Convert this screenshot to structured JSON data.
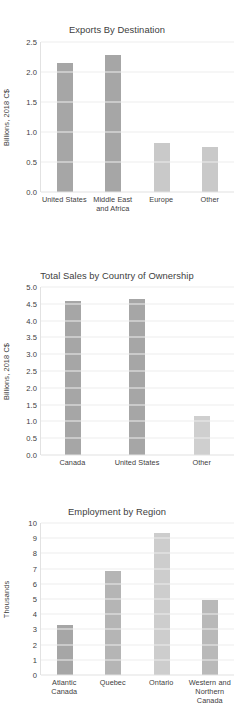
{
  "chart_data": [
    {
      "type": "bar",
      "title": "Exports By Destination",
      "xlabel": "",
      "ylabel": "Billions, 2018 C$",
      "categories": [
        "United States",
        "Middle East and Africa",
        "Europe",
        "Other"
      ],
      "values": [
        2.15,
        2.28,
        0.82,
        0.75
      ],
      "ylim": [
        0,
        2.5
      ],
      "yticks": [
        "0.0",
        "0.5",
        "1.0",
        "1.5",
        "2.0",
        "2.5"
      ],
      "ytick_values": [
        0,
        0.5,
        1,
        1.5,
        2,
        2.5
      ],
      "bar_colors": [
        "#a6a6a6",
        "#a6a6a6",
        "#c9c9c9",
        "#c9c9c9"
      ],
      "grid": true,
      "legend": "none"
    },
    {
      "type": "bar",
      "title": "Total Sales by Country of Ownership",
      "xlabel": "",
      "ylabel": "Billions, 2018 C$",
      "categories": [
        "Canada",
        "United States",
        "Other"
      ],
      "values": [
        4.57,
        4.63,
        1.17
      ],
      "ylim": [
        0,
        5.0
      ],
      "yticks": [
        "0.0",
        "0.5",
        "1.0",
        "1.5",
        "2.0",
        "2.5",
        "3.0",
        "3.5",
        "4.0",
        "4.5",
        "5.0"
      ],
      "ytick_values": [
        0,
        0.5,
        1,
        1.5,
        2,
        2.5,
        3,
        3.5,
        4,
        4.5,
        5
      ],
      "bar_colors": [
        "#a6a6a6",
        "#a6a6a6",
        "#cfcfcf"
      ],
      "grid": true,
      "legend": "none"
    },
    {
      "type": "bar",
      "title": "Employment by Region",
      "xlabel": "",
      "ylabel": "Thousands",
      "categories": [
        "Atlantic Canada",
        "Quebec",
        "Ontario",
        "Western and Northern Canada"
      ],
      "values": [
        3.3,
        6.85,
        9.35,
        4.95
      ],
      "ylim": [
        0,
        10
      ],
      "yticks": [
        "0",
        "1",
        "2",
        "3",
        "4",
        "5",
        "6",
        "7",
        "8",
        "9",
        "10"
      ],
      "ytick_values": [
        0,
        1,
        2,
        3,
        4,
        5,
        6,
        7,
        8,
        9,
        10
      ],
      "bar_colors": [
        "#a6a6a6",
        "#b5b5b5",
        "#cdcdcd",
        "#b9b9b9"
      ],
      "grid": true,
      "legend": "none"
    }
  ],
  "colors": {
    "background": "#ffffff",
    "text": "#404040",
    "gridline": "#ededed",
    "axis": "#e2e2e2",
    "bar_dark": "#a6a6a6",
    "bar_light": "#c9c9c9"
  }
}
